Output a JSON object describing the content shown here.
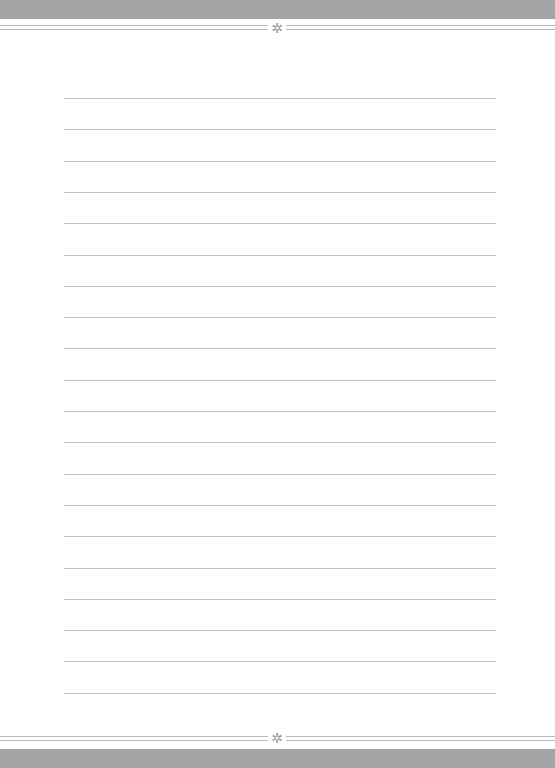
{
  "page": {
    "type": "lined-writing-paper",
    "header_ornament": "✲",
    "footer_ornament": "✲",
    "line_count": 20,
    "colors": {
      "band": "#a4a4a4",
      "rule": "#b8b8b8",
      "ruled_line": "#c4c4c4",
      "paper": "#ffffff"
    }
  }
}
